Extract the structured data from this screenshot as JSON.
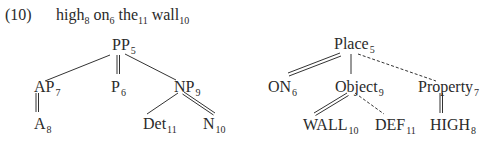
{
  "example": {
    "number": "(10)",
    "sentence": [
      {
        "word": "high",
        "index": "8"
      },
      {
        "word": "on",
        "index": "6"
      },
      {
        "word": "the",
        "index": "11"
      },
      {
        "word": "wall",
        "index": "10"
      }
    ]
  },
  "syntax_tree": {
    "nodes": {
      "pp": {
        "label": "PP",
        "index": "5"
      },
      "ap": {
        "label": "AP",
        "index": "7"
      },
      "p": {
        "label": "P",
        "index": "6"
      },
      "np": {
        "label": "NP",
        "index": "9"
      },
      "a": {
        "label": "A",
        "index": "8"
      },
      "det": {
        "label": "Det",
        "index": "11"
      },
      "n": {
        "label": "N",
        "index": "10"
      }
    }
  },
  "semantic_tree": {
    "nodes": {
      "place": {
        "label": "Place",
        "index": "5"
      },
      "on": {
        "label": "ON",
        "index": "6"
      },
      "object": {
        "label": "Object",
        "index": "9"
      },
      "property": {
        "label": "Property",
        "index": "7"
      },
      "wall": {
        "label": "WALL",
        "index": "10"
      },
      "def": {
        "label": "DEF",
        "index": "11"
      },
      "high": {
        "label": "HIGH",
        "index": "8"
      }
    }
  }
}
